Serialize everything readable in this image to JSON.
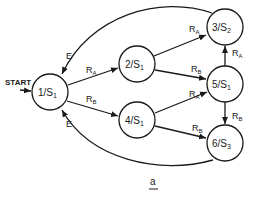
{
  "diagram": {
    "caption": "a",
    "start_label": "START",
    "states": [
      {
        "id": "1",
        "label": "1/S",
        "sub": "1",
        "cx": 50,
        "cy": 92
      },
      {
        "id": "2",
        "label": "2/S",
        "sub": "1",
        "cx": 137,
        "cy": 64
      },
      {
        "id": "3",
        "label": "3/S",
        "sub": "2",
        "cx": 225,
        "cy": 27
      },
      {
        "id": "4",
        "label": "4/S",
        "sub": "1",
        "cx": 137,
        "cy": 120
      },
      {
        "id": "5",
        "label": "5/S",
        "sub": "1",
        "cx": 225,
        "cy": 84
      },
      {
        "id": "6",
        "label": "6/S",
        "sub": "3",
        "cx": 225,
        "cy": 143
      }
    ],
    "transitions": [
      {
        "from": "1",
        "to": "2",
        "label": "R",
        "sub": "A"
      },
      {
        "from": "1",
        "to": "4",
        "label": "R",
        "sub": "B"
      },
      {
        "from": "2",
        "to": "3",
        "label": "R",
        "sub": "A"
      },
      {
        "from": "2",
        "to": "5",
        "label": "R",
        "sub": "B"
      },
      {
        "from": "4",
        "to": "5",
        "label": "R",
        "sub": "A"
      },
      {
        "from": "4",
        "to": "6",
        "label": "R",
        "sub": "B"
      },
      {
        "from": "5",
        "to": "3",
        "label": "R",
        "sub": "A"
      },
      {
        "from": "5",
        "to": "6",
        "label": "R",
        "sub": "B"
      },
      {
        "from": "3",
        "to": "1",
        "label": "E",
        "sub": ""
      },
      {
        "from": "6",
        "to": "1",
        "label": "E",
        "sub": ""
      }
    ]
  }
}
